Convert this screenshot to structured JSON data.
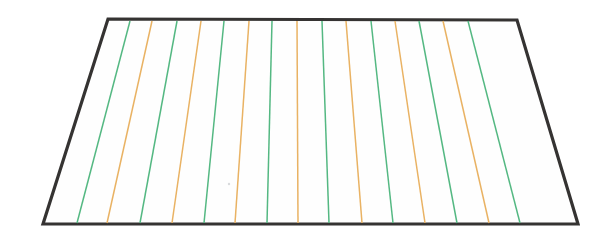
{
  "figure": {
    "kind": "line-diagram",
    "title": "",
    "caption": "",
    "background_color": "#ffffff",
    "canvas": {
      "width": 602,
      "height": 245
    }
  },
  "outline": {
    "name": "trapezoid-outline",
    "stroke_color": "#353332",
    "stroke_width": 3.2,
    "fill_color": "#fefefe",
    "corners": {
      "top_left": {
        "x": 108,
        "y": 19
      },
      "top_right": {
        "x": 517,
        "y": 20
      },
      "bottom_right": {
        "x": 578,
        "y": 224
      },
      "bottom_left": {
        "x": 43,
        "y": 224
      }
    },
    "points": "108,19 517,20 578,224 43,224"
  },
  "strip_lines": {
    "count": 15,
    "stroke_width": 1.5,
    "colors": {
      "green": "#54b882",
      "orange": "#e9b263"
    },
    "legend": [
      {
        "key": "green",
        "label": "green strip line",
        "color": "#54b882"
      },
      {
        "key": "orange",
        "label": "orange strip line",
        "color": "#e9b263"
      }
    ],
    "lines": [
      {
        "index": 1,
        "color_key": "green",
        "color": "#54b882",
        "x_top": 130,
        "x_bottom": 77
      },
      {
        "index": 2,
        "color_key": "orange",
        "color": "#e9b263",
        "x_top": 152,
        "x_bottom": 107
      },
      {
        "index": 3,
        "color_key": "green",
        "color": "#54b882",
        "x_top": 177,
        "x_bottom": 140
      },
      {
        "index": 4,
        "color_key": "orange",
        "color": "#e9b263",
        "x_top": 201,
        "x_bottom": 172
      },
      {
        "index": 5,
        "color_key": "green",
        "color": "#54b882",
        "x_top": 224,
        "x_bottom": 204
      },
      {
        "index": 6,
        "color_key": "orange",
        "color": "#e9b263",
        "x_top": 249,
        "x_bottom": 235
      },
      {
        "index": 7,
        "color_key": "green",
        "color": "#54b882",
        "x_top": 272,
        "x_bottom": 267
      },
      {
        "index": 8,
        "color_key": "orange",
        "color": "#e9b263",
        "x_top": 297,
        "x_bottom": 298
      },
      {
        "index": 9,
        "color_key": "green",
        "color": "#54b882",
        "x_top": 322,
        "x_bottom": 329
      },
      {
        "index": 10,
        "color_key": "orange",
        "color": "#e9b263",
        "x_top": 346,
        "x_bottom": 362
      },
      {
        "index": 11,
        "color_key": "green",
        "color": "#54b882",
        "x_top": 371,
        "x_bottom": 393
      },
      {
        "index": 12,
        "color_key": "orange",
        "color": "#e9b263",
        "x_top": 395,
        "x_bottom": 425
      },
      {
        "index": 13,
        "color_key": "green",
        "color": "#54b882",
        "x_top": 419,
        "x_bottom": 457
      },
      {
        "index": 14,
        "color_key": "orange",
        "color": "#e9b263",
        "x_top": 443,
        "x_bottom": 489
      },
      {
        "index": 15,
        "color_key": "green",
        "color": "#54b882",
        "x_top": 468,
        "x_bottom": 520
      }
    ],
    "y_top": 21,
    "y_bottom": 223
  },
  "speck": {
    "name": "stray-mark",
    "x": 229,
    "y": 184,
    "radius": 1.2,
    "color": "#b8bcc0"
  }
}
